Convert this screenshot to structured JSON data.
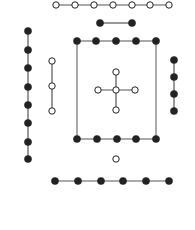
{
  "diagram": {
    "colors": {
      "ink": "#222222",
      "line": "#555555",
      "background": "#ffffff"
    },
    "groups": [
      {
        "name": "top-white-row",
        "fill": "white",
        "count": 7,
        "points": [
          [
            56,
            5
          ],
          [
            75,
            5
          ],
          [
            94,
            5
          ],
          [
            113,
            5
          ],
          [
            132,
            5
          ],
          [
            150,
            5
          ],
          [
            169,
            5
          ]
        ]
      },
      {
        "name": "top-black-pair",
        "fill": "black",
        "count": 2,
        "points": [
          [
            100,
            23
          ],
          [
            132,
            23
          ]
        ]
      },
      {
        "name": "left-black-column",
        "fill": "black",
        "count": 8,
        "points": [
          [
            28,
            31
          ],
          [
            28,
            50
          ],
          [
            28,
            68
          ],
          [
            28,
            87
          ],
          [
            28,
            105
          ],
          [
            28,
            123
          ],
          [
            28,
            142
          ],
          [
            28,
            159
          ]
        ]
      },
      {
        "name": "left-white-column",
        "fill": "white",
        "count": 3,
        "points": [
          [
            52,
            61
          ],
          [
            52,
            86
          ],
          [
            52,
            111
          ]
        ]
      },
      {
        "name": "square-top-row",
        "fill": "black",
        "count": 5,
        "points": [
          [
            77,
            41
          ],
          [
            96,
            41
          ],
          [
            116,
            41
          ],
          [
            136,
            41
          ],
          [
            156,
            41
          ]
        ]
      },
      {
        "name": "square-bottom-row",
        "fill": "black",
        "count": 5,
        "points": [
          [
            77,
            139
          ],
          [
            97,
            139
          ],
          [
            117,
            139
          ],
          [
            136,
            139
          ],
          [
            156,
            139
          ]
        ]
      },
      {
        "name": "center-cross",
        "fill": "white",
        "count": 5,
        "points": [
          [
            116,
            72
          ],
          [
            98,
            90
          ],
          [
            116,
            90
          ],
          [
            135,
            90
          ],
          [
            116,
            110
          ]
        ]
      },
      {
        "name": "right-black-column",
        "fill": "black",
        "count": 4,
        "points": [
          [
            174,
            60
          ],
          [
            174,
            77
          ],
          [
            174,
            94
          ],
          [
            174,
            111
          ]
        ]
      },
      {
        "name": "bottom-white-single",
        "fill": "white",
        "count": 1,
        "points": [
          [
            116,
            159
          ]
        ]
      },
      {
        "name": "bottom-black-row",
        "fill": "black",
        "count": 6,
        "points": [
          [
            55,
            181
          ],
          [
            78,
            181
          ],
          [
            101,
            181
          ],
          [
            123,
            181
          ],
          [
            146,
            181
          ],
          [
            169,
            181
          ]
        ]
      }
    ]
  }
}
